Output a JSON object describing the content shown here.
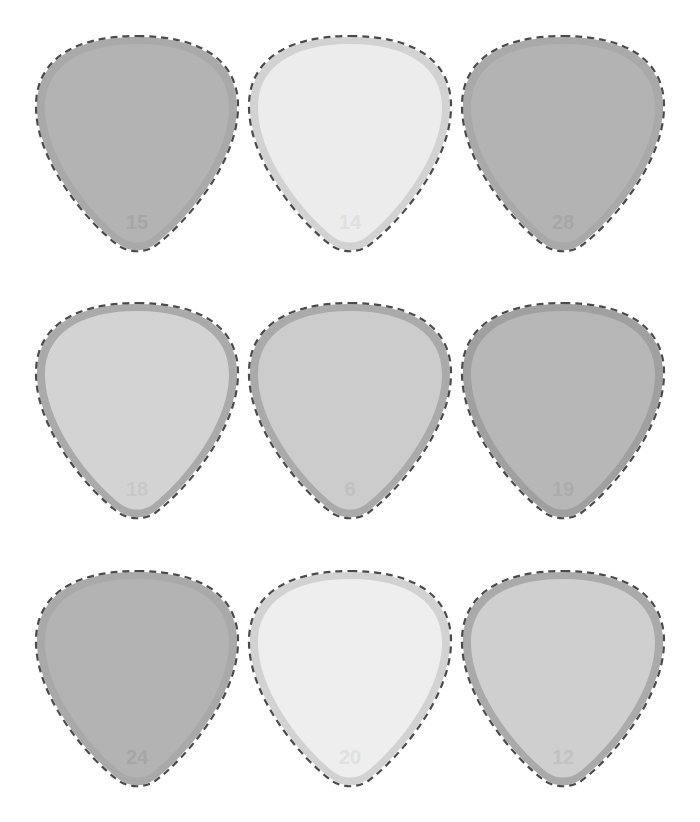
{
  "tiles": [
    {
      "label": "15",
      "fill": "#b3b3b3",
      "rim": "#a9a9a9",
      "numcolor": "#a6a6a6",
      "x": 34,
      "y": 33,
      "w": 206,
      "h": 220
    },
    {
      "label": "14",
      "fill": "#ececec",
      "rim": "#d2d2d2",
      "numcolor": "#e0e0e0",
      "x": 247,
      "y": 33,
      "w": 206,
      "h": 220
    },
    {
      "label": "28",
      "fill": "#b3b3b3",
      "rim": "#a9a9a9",
      "numcolor": "#a6a6a6",
      "x": 460,
      "y": 33,
      "w": 206,
      "h": 220
    },
    {
      "label": "18",
      "fill": "#d3d3d3",
      "rim": "#aaaaaa",
      "numcolor": "#c8c8c8",
      "x": 34,
      "y": 300,
      "w": 206,
      "h": 220
    },
    {
      "label": "6",
      "fill": "#cccccc",
      "rim": "#aaaaaa",
      "numcolor": "#c0c0c0",
      "x": 247,
      "y": 300,
      "w": 206,
      "h": 220
    },
    {
      "label": "19",
      "fill": "#b7b7b7",
      "rim": "#a0a0a0",
      "numcolor": "#acacac",
      "x": 460,
      "y": 300,
      "w": 206,
      "h": 220
    },
    {
      "label": "24",
      "fill": "#b3b3b3",
      "rim": "#a9a9a9",
      "numcolor": "#a6a6a6",
      "x": 34,
      "y": 568,
      "w": 206,
      "h": 220
    },
    {
      "label": "20",
      "fill": "#eeeeee",
      "rim": "#d2d2d2",
      "numcolor": "#e0e0e0",
      "x": 247,
      "y": 568,
      "w": 206,
      "h": 220
    },
    {
      "label": "12",
      "fill": "#cfcfcf",
      "rim": "#aaaaaa",
      "numcolor": "#c2c2c2",
      "x": 460,
      "y": 568,
      "w": 206,
      "h": 220
    }
  ],
  "outline": {
    "color": "#4a4a4a",
    "dash": "7 5"
  }
}
